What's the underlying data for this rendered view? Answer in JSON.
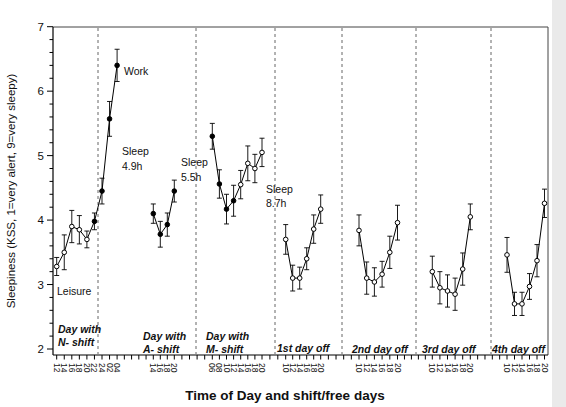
{
  "figure_title": "",
  "colors": {
    "data": "#000000",
    "frame": "#444444",
    "separator": "#555555",
    "background": "#ffffff",
    "scan_edge": "#dcdcdc"
  },
  "chart_data": {
    "type": "line",
    "title": "",
    "ylabel": "Sleepiness (KSS, 1=very alert, 9=very sleepy)",
    "xlabel": "Time of Day and shift/free days",
    "ylim": [
      2,
      7
    ],
    "y_ticks": [
      2,
      3,
      4,
      5,
      6,
      7
    ],
    "y_minor_step": 0.2,
    "grid": false,
    "legend_position": "none",
    "marker_note": "filled circles = work periods, open circles = leisure/days off",
    "panels": [
      {
        "label_lines": [
          "Day with",
          "N- shift"
        ],
        "x": [
          "12",
          "14",
          "16",
          "18",
          "20",
          "22",
          "24",
          "02",
          "04"
        ],
        "values": [
          3.28,
          3.5,
          3.9,
          3.85,
          3.7,
          3.98,
          4.45,
          5.57,
          6.4
        ],
        "errors": [
          0.14,
          0.27,
          0.25,
          0.22,
          0.13,
          0.13,
          0.2,
          0.27,
          0.25
        ],
        "filled": [
          false,
          false,
          false,
          false,
          false,
          true,
          true,
          true,
          true
        ]
      },
      {
        "label_lines": [
          "Day with",
          "A- shift"
        ],
        "x": [
          "14",
          "16",
          "18",
          "20"
        ],
        "values": [
          4.1,
          3.78,
          3.93,
          4.45
        ],
        "errors": [
          0.15,
          0.2,
          0.18,
          0.17
        ],
        "filled": [
          true,
          true,
          true,
          true
        ]
      },
      {
        "label_lines": [
          "Day with",
          "M- shift"
        ],
        "x": [
          "06",
          "08",
          "10",
          "12",
          "14",
          "16",
          "18",
          "20"
        ],
        "values": [
          5.3,
          4.56,
          4.17,
          4.3,
          4.55,
          4.88,
          4.8,
          5.05
        ],
        "errors": [
          0.2,
          0.22,
          0.23,
          0.24,
          0.22,
          0.27,
          0.22,
          0.22
        ],
        "filled": [
          true,
          true,
          true,
          true,
          false,
          false,
          false,
          false
        ]
      },
      {
        "label_lines": [
          "1st day off"
        ],
        "x": [
          "10",
          "12",
          "14",
          "16",
          "18",
          "20"
        ],
        "values": [
          3.7,
          3.1,
          3.1,
          3.4,
          3.86,
          4.17
        ],
        "errors": [
          0.23,
          0.2,
          0.17,
          0.17,
          0.22,
          0.22
        ],
        "filled": [
          false,
          false,
          false,
          false,
          false,
          false
        ]
      },
      {
        "label_lines": [
          "2nd day off"
        ],
        "x": [
          "10",
          "12",
          "14",
          "16",
          "18",
          "20"
        ],
        "values": [
          3.84,
          3.1,
          3.04,
          3.16,
          3.5,
          3.96
        ],
        "errors": [
          0.24,
          0.25,
          0.22,
          0.2,
          0.25,
          0.27
        ],
        "filled": [
          false,
          false,
          false,
          false,
          false,
          false
        ]
      },
      {
        "label_lines": [
          "3rd day off"
        ],
        "x": [
          "10",
          "12",
          "14",
          "16",
          "18",
          "20"
        ],
        "values": [
          3.2,
          2.95,
          2.9,
          2.85,
          3.24,
          4.05
        ],
        "errors": [
          0.24,
          0.25,
          0.25,
          0.25,
          0.25,
          0.2
        ],
        "filled": [
          false,
          false,
          false,
          false,
          false,
          false
        ]
      },
      {
        "label_lines": [
          "4th day off"
        ],
        "x": [
          "10",
          "12",
          "14",
          "16",
          "18",
          "20"
        ],
        "values": [
          3.46,
          2.7,
          2.7,
          2.97,
          3.37,
          4.26
        ],
        "errors": [
          0.27,
          0.18,
          0.18,
          0.2,
          0.25,
          0.22
        ],
        "filled": [
          false,
          false,
          false,
          false,
          false,
          false
        ]
      }
    ],
    "annotations": [
      {
        "id": "work",
        "lines": [
          "Work"
        ]
      },
      {
        "id": "sleep-1",
        "lines": [
          "Sleep",
          "4.9h"
        ]
      },
      {
        "id": "sleep-2",
        "lines": [
          "Sleep",
          "5.5h"
        ]
      },
      {
        "id": "sleep-3",
        "lines": [
          "Sleep",
          "8.7h"
        ]
      },
      {
        "id": "leisure",
        "lines": [
          "Leisure"
        ]
      }
    ]
  }
}
